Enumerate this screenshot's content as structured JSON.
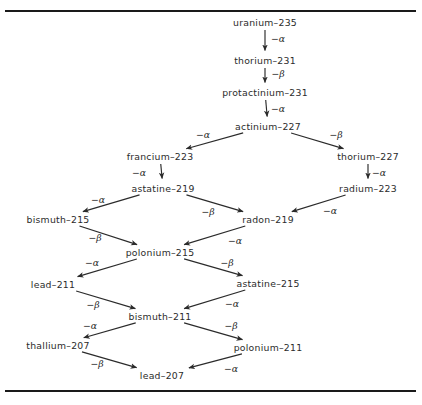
{
  "figure": {
    "type": "decay-chain-diagram",
    "rules": {
      "top_label": "top-horizontal-rule",
      "bottom_label": "bottom-horizontal-rule"
    }
  },
  "nodes": [
    {
      "id": "u235",
      "label": "uranium–235",
      "x": 265,
      "y": 22
    },
    {
      "id": "th231",
      "label": "thorium–231",
      "x": 265,
      "y": 60
    },
    {
      "id": "pa231",
      "label": "protactinium–231",
      "x": 265,
      "y": 92
    },
    {
      "id": "ac227",
      "label": "actinium–227",
      "x": 268,
      "y": 126
    },
    {
      "id": "fr223",
      "label": "francium–223",
      "x": 160,
      "y": 156
    },
    {
      "id": "th227",
      "label": "thorium–227",
      "x": 368,
      "y": 156
    },
    {
      "id": "at219",
      "label": "astatine–219",
      "x": 163,
      "y": 188
    },
    {
      "id": "ra223",
      "label": "radium–223",
      "x": 368,
      "y": 188
    },
    {
      "id": "bi215",
      "label": "bismuth–215",
      "x": 58,
      "y": 219
    },
    {
      "id": "rn219",
      "label": "radon–219",
      "x": 268,
      "y": 219
    },
    {
      "id": "po215",
      "label": "polonium–215",
      "x": 160,
      "y": 252
    },
    {
      "id": "pb211",
      "label": "lead–211",
      "x": 53,
      "y": 284
    },
    {
      "id": "at215",
      "label": "astatine–215",
      "x": 268,
      "y": 283
    },
    {
      "id": "bi211",
      "label": "bismuth–211",
      "x": 160,
      "y": 316
    },
    {
      "id": "tl207",
      "label": "thallium–207",
      "x": 58,
      "y": 345
    },
    {
      "id": "po211",
      "label": "polonium–211",
      "x": 268,
      "y": 347
    },
    {
      "id": "pb207",
      "label": "lead–207",
      "x": 162,
      "y": 375
    }
  ],
  "edges": [
    {
      "id": "e1",
      "from": "u235",
      "to": "th231",
      "decay": "−α",
      "lx": 278,
      "ly": 38
    },
    {
      "id": "e2",
      "from": "th231",
      "to": "pa231",
      "decay": "−β",
      "lx": 278,
      "ly": 73
    },
    {
      "id": "e3",
      "from": "pa231",
      "to": "ac227",
      "decay": "−α",
      "lx": 278,
      "ly": 108
    },
    {
      "id": "e4",
      "from": "ac227",
      "to": "fr223",
      "decay": "−α",
      "lx": 203,
      "ly": 134
    },
    {
      "id": "e5",
      "from": "ac227",
      "to": "th227",
      "decay": "−β",
      "lx": 336,
      "ly": 134
    },
    {
      "id": "e6",
      "from": "fr223",
      "to": "at219",
      "decay": "−α",
      "lx": 139,
      "ly": 172
    },
    {
      "id": "e7",
      "from": "th227",
      "to": "ra223",
      "decay": "−α",
      "lx": 379,
      "ly": 172
    },
    {
      "id": "e8",
      "from": "at219",
      "to": "bi215",
      "decay": "−α",
      "lx": 98,
      "ly": 199
    },
    {
      "id": "e9",
      "from": "at219",
      "to": "rn219",
      "decay": "−β",
      "lx": 208,
      "ly": 211
    },
    {
      "id": "e10",
      "from": "ra223",
      "to": "rn219",
      "decay": "−α",
      "lx": 330,
      "ly": 210
    },
    {
      "id": "e11",
      "from": "bi215",
      "to": "po215",
      "decay": "−β",
      "lx": 95,
      "ly": 237
    },
    {
      "id": "e12",
      "from": "rn219",
      "to": "po215",
      "decay": "−α",
      "lx": 235,
      "ly": 240
    },
    {
      "id": "e13",
      "from": "po215",
      "to": "pb211",
      "decay": "−α",
      "lx": 92,
      "ly": 262
    },
    {
      "id": "e14",
      "from": "po215",
      "to": "at215",
      "decay": "−β",
      "lx": 227,
      "ly": 262
    },
    {
      "id": "e15",
      "from": "pb211",
      "to": "bi211",
      "decay": "−β",
      "lx": 93,
      "ly": 304
    },
    {
      "id": "e16",
      "from": "at215",
      "to": "bi211",
      "decay": "−α",
      "lx": 232,
      "ly": 303
    },
    {
      "id": "e17",
      "from": "bi211",
      "to": "tl207",
      "decay": "−α",
      "lx": 90,
      "ly": 325
    },
    {
      "id": "e18",
      "from": "bi211",
      "to": "po211",
      "decay": "−β",
      "lx": 231,
      "ly": 325
    },
    {
      "id": "e19",
      "from": "tl207",
      "to": "pb207",
      "decay": "−β",
      "lx": 97,
      "ly": 363
    },
    {
      "id": "e20",
      "from": "po211",
      "to": "pb207",
      "decay": "−α",
      "lx": 231,
      "ly": 368
    }
  ],
  "colors": {
    "ink": "#2b2b2b",
    "rule": "#1a1a1a",
    "background": "#ffffff"
  }
}
